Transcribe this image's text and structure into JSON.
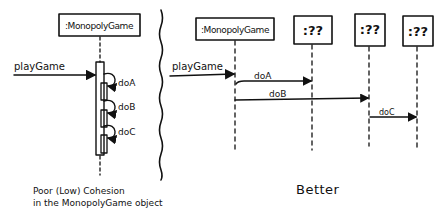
{
  "left_panel": {
    "object": {
      "label": ":MonopolyGame"
    },
    "incoming_message": "playGame",
    "self_calls": [
      {
        "label": "doA"
      },
      {
        "label": "doB"
      },
      {
        "label": "doC"
      }
    ],
    "caption_line1": "Poor (Low) Cohesion",
    "caption_line2": "in the MonopolyGame object"
  },
  "right_panel": {
    "objects": [
      {
        "label": ":MonopolyGame"
      },
      {
        "label": ":??"
      },
      {
        "label": ":??"
      },
      {
        "label": ":??"
      }
    ],
    "incoming_message": "playGame",
    "messages": [
      {
        "label": "doA",
        "from": 0,
        "to": 1
      },
      {
        "label": "doB",
        "from": 0,
        "to": 2
      },
      {
        "label": "doC",
        "from": 2,
        "to": 3
      }
    ],
    "caption": "Better"
  },
  "colors": {
    "ink": "#111111",
    "background": "#ffffff"
  }
}
